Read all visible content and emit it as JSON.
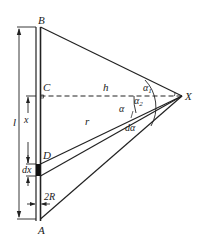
{
  "diagram": {
    "type": "physics-geometry",
    "labels": {
      "B": "B",
      "C": "C",
      "D": "D",
      "A": "A",
      "X": "X",
      "h": "h",
      "r": "r",
      "l": "l",
      "x": "x",
      "dx": "dx",
      "twoR": "2R",
      "alpha": "α",
      "alpha1": "α",
      "alpha1_sub": "1",
      "alpha2": "α",
      "alpha2_sub": "2",
      "dalpha": "dα"
    },
    "colors": {
      "line": "#222222",
      "background": "#ffffff"
    }
  }
}
